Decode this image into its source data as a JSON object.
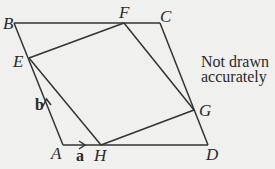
{
  "diagram": {
    "type": "geometry-parallelogram",
    "points": {
      "A": {
        "label": "A",
        "x": 63,
        "y": 145
      },
      "B": {
        "label": "B",
        "x": 14,
        "y": 23
      },
      "C": {
        "label": "C",
        "x": 160,
        "y": 23
      },
      "D": {
        "label": "D",
        "x": 208,
        "y": 145
      },
      "E": {
        "label": "E",
        "x": 29,
        "y": 58
      },
      "F": {
        "label": "F",
        "x": 124,
        "y": 23
      },
      "G": {
        "label": "G",
        "x": 194,
        "y": 110
      },
      "H": {
        "label": "H",
        "x": 101,
        "y": 145
      }
    },
    "edges": [
      [
        "A",
        "B"
      ],
      [
        "B",
        "C"
      ],
      [
        "C",
        "D"
      ],
      [
        "D",
        "A"
      ],
      [
        "E",
        "F"
      ],
      [
        "F",
        "G"
      ],
      [
        "G",
        "H"
      ],
      [
        "H",
        "E"
      ]
    ],
    "vectors": [
      {
        "name": "a",
        "label": "a",
        "from": "A",
        "toward": "D"
      },
      {
        "name": "b",
        "label": "b",
        "from": "A",
        "toward": "B"
      }
    ],
    "note": {
      "line1": "Not drawn",
      "line2": "accurately"
    }
  }
}
